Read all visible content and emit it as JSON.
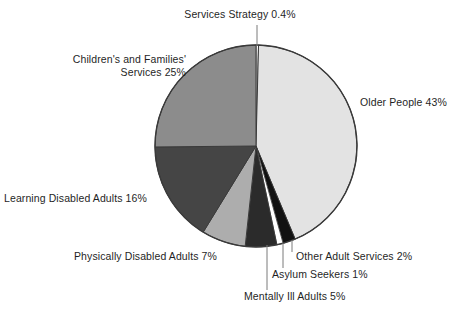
{
  "chart_data": {
    "type": "pie",
    "title": "",
    "subtitle": "",
    "xlabel": "",
    "ylabel": "",
    "legend_position": "none",
    "grid": false,
    "labels_shown_as": "callout labels with leader lines",
    "start_angle_deg": 0,
    "direction": "clockwise",
    "categories": [
      "Services Strategy",
      "Older People",
      "Other Adult Services",
      "Asylum Seekers",
      "Mentally Ill Adults",
      "Physically Disabled Adults",
      "Learning Disabled Adults",
      "Children's and Families' Services"
    ],
    "values": [
      0.4,
      43,
      2,
      1,
      5,
      7,
      16,
      25
    ],
    "unit": "%",
    "colors": [
      "#ffffff",
      "#e3e3e3",
      "#111111",
      "#ffffff",
      "#2b2b2b",
      "#adadad",
      "#454545",
      "#8c8c8c"
    ],
    "slice_outline_color": "#3a3a3a",
    "slices": [
      {
        "name": "Services Strategy",
        "value": 0.4,
        "label": "Services Strategy 0.4%",
        "color": "#ffffff"
      },
      {
        "name": "Older People",
        "value": 43,
        "label": "Older People 43%",
        "color": "#e3e3e3"
      },
      {
        "name": "Other Adult Services",
        "value": 2,
        "label": "Other Adult Services 2%",
        "color": "#111111"
      },
      {
        "name": "Asylum Seekers",
        "value": 1,
        "label": "Asylum Seekers 1%",
        "color": "#ffffff"
      },
      {
        "name": "Mentally Ill Adults",
        "value": 5,
        "label": "Mentally Ill Adults 5%",
        "color": "#2b2b2b"
      },
      {
        "name": "Physically Disabled Adults",
        "value": 7,
        "label": "Physically Disabled Adults 7%",
        "color": "#adadad"
      },
      {
        "name": "Learning Disabled Adults",
        "value": 16,
        "label": "Learning Disabled Adults 16%",
        "color": "#454545"
      },
      {
        "name": "Children's and Families' Services",
        "value": 25,
        "label": "Children's and Families'\nServices 25%",
        "color": "#8c8c8c"
      }
    ]
  },
  "labels": {
    "services_strategy": "Services Strategy 0.4%",
    "children_families": "Children's and Families'\nServices 25%",
    "older_people": "Older People 43%",
    "learning_disabled": "Learning Disabled Adults 16%",
    "physically_disabled": "Physically Disabled Adults 7%",
    "other_adult_services": "Other Adult Services 2%",
    "asylum_seekers": "Asylum Seekers 1%",
    "mentally_ill": "Mentally Ill Adults 5%"
  },
  "style": {
    "background": "#ffffff",
    "text_color": "#1f1f1f",
    "leader_line_color": "#6b6b6b",
    "outline_color": "#3a3a3a"
  }
}
